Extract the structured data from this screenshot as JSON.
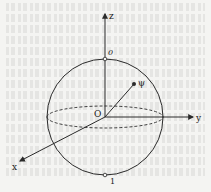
{
  "diagram": {
    "colors": {
      "line": "#2a2a2a",
      "background": "#f4f4f2"
    },
    "labels": {
      "z_axis": "z",
      "y_axis": "y",
      "x_axis": "x",
      "origin": "O",
      "state_vector": "ψ",
      "north_pole": "0",
      "south_pole": "1"
    },
    "geometry": {
      "center": [
        105,
        117
      ],
      "radius": 58,
      "equator_ry": 11,
      "state_point": [
        134,
        84
      ]
    }
  }
}
